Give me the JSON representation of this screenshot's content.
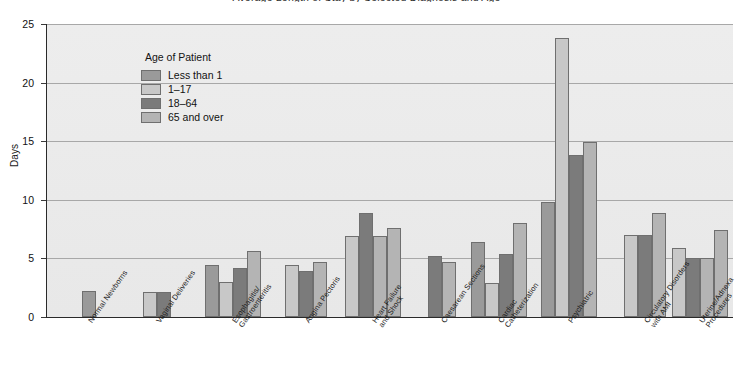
{
  "chart_data": {
    "type": "bar",
    "title": "Average Length of Stay by Selected Diagnosis and Age",
    "xlabel": "",
    "ylabel": "Days",
    "ylim": [
      0,
      25
    ],
    "yticks": [
      0,
      5,
      10,
      15,
      20,
      25
    ],
    "grid": true,
    "legend_title": "Age of Patient",
    "legend_position": "inside-top-left",
    "categories": [
      "Normal Newborns",
      "Vaginal Deliveries",
      "Esophagitis/\nGastroenteritis",
      "Angina Pectoris",
      "Heart Failure\nand Shock",
      "Caesarean Sections",
      "Cardiac\nCatheterization",
      "Psychiatric",
      "Circulatory Disorders\nwith AMI",
      "Uterine/Adnexa\nProcedures"
    ],
    "series": [
      {
        "name": "Less than 1",
        "color": "#9a9a9a",
        "values": [
          2.2,
          null,
          4.4,
          null,
          null,
          null,
          6.4,
          9.8,
          null,
          null
        ]
      },
      {
        "name": "1-17",
        "color": "#c8c8c8",
        "values": [
          null,
          2.1,
          3.0,
          4.4,
          6.9,
          null,
          2.9,
          23.8,
          7.0,
          5.9
        ]
      },
      {
        "name": "18-64",
        "color": "#7b7b7b",
        "values": [
          null,
          2.1,
          4.2,
          3.9,
          8.9,
          5.2,
          5.4,
          13.8,
          7.0,
          5.0
        ]
      },
      {
        "name": "65 and over",
        "color": "#b4b4b4",
        "values": [
          null,
          null,
          5.6,
          4.7,
          6.9,
          4.7,
          8.0,
          14.9,
          8.9,
          5.0
        ]
      },
      {
        "name": "65 and over (extra)",
        "color": "#b4b4b4",
        "values": [
          null,
          null,
          null,
          null,
          7.6,
          null,
          null,
          null,
          null,
          7.4
        ]
      }
    ]
  },
  "legend": {
    "title": "Age of Patient",
    "items": [
      {
        "label": "Less than 1",
        "color": "#9a9a9a"
      },
      {
        "label": "1–17",
        "color": "#c8c8c8"
      },
      {
        "label": "18–64",
        "color": "#7b7b7b"
      },
      {
        "label": "65 and over",
        "color": "#b4b4b4"
      }
    ]
  },
  "axes": {
    "y_label": "Days",
    "y_ticks": [
      "0",
      "5",
      "10",
      "15",
      "20",
      "25"
    ],
    "x_labels": [
      "Normal Newborns",
      "Vaginal Deliveries",
      "Esophagitis/\nGastroenteritis",
      "Angina Pectoris",
      "Heart Failure\nand Shock",
      "Caesarean Sections",
      "Cardiac\nCatheterization",
      "Psychiatric",
      "Circulatory Disorders\nwith AMI",
      "Uterine/Adnexa\nProcedures"
    ]
  },
  "colors": {
    "plot_background": "#ebebeb",
    "gridline": "#a8a8a8",
    "axis": "#2a2a2a",
    "bar_border": "#6f6f6f"
  }
}
